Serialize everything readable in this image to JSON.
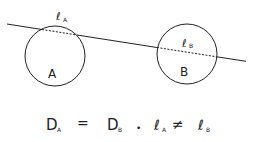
{
  "diagram": {
    "circle_a": {
      "label": "A",
      "chord_label": "ℓ",
      "chord_sub": "A"
    },
    "circle_b": {
      "label": "B",
      "chord_label": "ℓ",
      "chord_sub": "B"
    },
    "equation": {
      "d_a": "D",
      "d_a_sub": "A",
      "equals": "=",
      "d_b": "D",
      "d_b_sub": "B",
      "separator": "•",
      "l_a": "ℓ",
      "l_a_sub": "A",
      "not_equal": "≠",
      "l_b": "ℓ",
      "l_b_sub": "B"
    },
    "colors": {
      "stroke": "#222222",
      "background": "#ffffff"
    }
  }
}
